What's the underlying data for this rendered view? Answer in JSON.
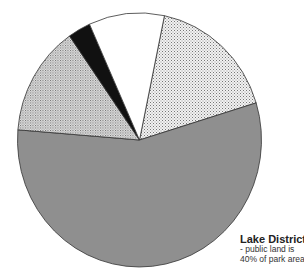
{
  "chart_data": {
    "type": "pie",
    "title": "Lake District",
    "subtitle": "- public land is 40% of park area",
    "labels_visible": false,
    "legend": "none",
    "start_angle_deg": 11.8,
    "direction": "clockwise",
    "slices": [
      {
        "name": "slice-right-light-stipple",
        "value": 17,
        "fill": "stipple-light",
        "color": "#e4e4e4"
      },
      {
        "name": "slice-grey",
        "value": 56,
        "fill": "solid",
        "color": "#8f8f8f"
      },
      {
        "name": "slice-left-dense-stipple",
        "value": 14,
        "fill": "stipple-dense",
        "color": "#d2d2d2"
      },
      {
        "name": "slice-black",
        "value": 3,
        "fill": "solid",
        "color": "#111111"
      },
      {
        "name": "slice-white",
        "value": 10,
        "fill": "solid",
        "color": "#ffffff"
      }
    ]
  },
  "caption": {
    "title": "Lake District",
    "line1": "- public land is",
    "line2": "40% of park area"
  }
}
